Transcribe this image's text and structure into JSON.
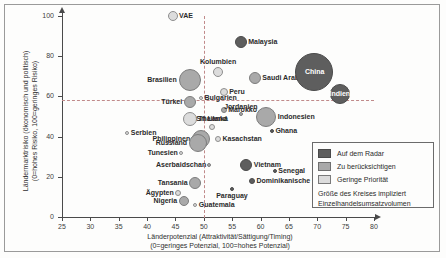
{
  "chart_data": {
    "type": "scatter",
    "title": "",
    "xlabel": "Länderpotenzial (Attraktivität/Sättigung/Timing)",
    "xlabel_sub": "(0=geringes Potenzial, 100=hohes Potenzial)",
    "ylabel": "Ländermarktrisiko (ökonomisch und politisch)",
    "ylabel_sub": "(0=hohes Risiko, 100=geringes Risiko)",
    "xlim": [
      25,
      80
    ],
    "ylim": [
      0,
      100
    ],
    "xticks": [
      25,
      30,
      35,
      40,
      45,
      50,
      55,
      60,
      65,
      70,
      75,
      80
    ],
    "yticks": [
      0,
      20,
      40,
      60,
      80,
      100
    ],
    "grid": false,
    "reference_lines": {
      "x": 50,
      "y": 58
    },
    "size_meaning": "Größe des Kreises impliziert Einzelhandelsumsatzvolumen",
    "points": [
      {
        "name": "VAE",
        "x": 44.5,
        "y": 100,
        "size": 5,
        "tier": "light",
        "label_pos": "right"
      },
      {
        "name": "Malaysia",
        "x": 56.5,
        "y": 87,
        "size": 6,
        "tier": "dark",
        "label_pos": "right"
      },
      {
        "name": "Kolumbien",
        "x": 52.5,
        "y": 72,
        "size": 5,
        "tier": "light",
        "label_pos": "top"
      },
      {
        "name": "Saudi Arabien",
        "x": 59.0,
        "y": 69,
        "size": 6,
        "tier": "mid",
        "label_pos": "right"
      },
      {
        "name": "Brasilien",
        "x": 47.5,
        "y": 68,
        "size": 11,
        "tier": "mid",
        "label_pos": "left"
      },
      {
        "name": "China",
        "x": 69.5,
        "y": 72,
        "size": 19,
        "tier": "dark",
        "label_pos": "center"
      },
      {
        "name": "Indien",
        "x": 74.0,
        "y": 61,
        "size": 10,
        "tier": "dark",
        "label_pos": "center"
      },
      {
        "name": "Peru",
        "x": 53.5,
        "y": 62,
        "size": 4,
        "tier": "light",
        "label_pos": "right"
      },
      {
        "name": "Türkei",
        "x": 47.5,
        "y": 57,
        "size": 6,
        "tier": "mid",
        "label_pos": "left"
      },
      {
        "name": "Bulgarien",
        "x": 49.5,
        "y": 59,
        "size": 2,
        "tier": "light",
        "label_pos": "right"
      },
      {
        "name": "Marokko",
        "x": 53.5,
        "y": 53,
        "size": 3,
        "tier": "mid",
        "label_pos": "right"
      },
      {
        "name": "Jordanien",
        "x": 56.5,
        "y": 51,
        "size": 2,
        "tier": "mid",
        "label_pos": "top"
      },
      {
        "name": "Indonesien",
        "x": 61.0,
        "y": 50,
        "size": 10,
        "tier": "mid",
        "label_pos": "right"
      },
      {
        "name": "Thailand",
        "x": 47.5,
        "y": 49,
        "size": 7,
        "tier": "light",
        "label_pos": "right"
      },
      {
        "name": "Sri Lanka",
        "x": 51.5,
        "y": 45,
        "size": 3,
        "tier": "light",
        "label_pos": "top"
      },
      {
        "name": "Ghana",
        "x": 62.0,
        "y": 43,
        "size": 2,
        "tier": "dark",
        "label_pos": "right"
      },
      {
        "name": "Serbien",
        "x": 36.5,
        "y": 42,
        "size": 2,
        "tier": "light",
        "label_pos": "right"
      },
      {
        "name": "Philippinen",
        "x": 49.5,
        "y": 39,
        "size": 9,
        "tier": "mid",
        "label_pos": "left"
      },
      {
        "name": "Russland",
        "x": 49.0,
        "y": 37,
        "size": 9,
        "tier": "mid",
        "label_pos": "left"
      },
      {
        "name": "Kasachstan",
        "x": 52.5,
        "y": 39,
        "size": 3,
        "tier": "light",
        "label_pos": "right"
      },
      {
        "name": "Tunesien",
        "x": 46.0,
        "y": 32,
        "size": 2,
        "tier": "light",
        "label_pos": "left"
      },
      {
        "name": "Aserbaidschan",
        "x": 51.0,
        "y": 26,
        "size": 2,
        "tier": "mid",
        "label_pos": "left"
      },
      {
        "name": "Vietnam",
        "x": 57.5,
        "y": 26,
        "size": 6,
        "tier": "dark",
        "label_pos": "right"
      },
      {
        "name": "Senegal",
        "x": 62.5,
        "y": 23,
        "size": 2,
        "tier": "dark",
        "label_pos": "right"
      },
      {
        "name": "Tansania",
        "x": 48.5,
        "y": 17,
        "size": 6,
        "tier": "mid",
        "label_pos": "left"
      },
      {
        "name": "Dominikanische Republik",
        "x": 58.5,
        "y": 18,
        "size": 3,
        "tier": "dark",
        "label_pos": "right"
      },
      {
        "name": "Paraguay",
        "x": 55.0,
        "y": 14,
        "size": 2,
        "tier": "dark",
        "label_pos": "bottom"
      },
      {
        "name": "Ägypten",
        "x": 45.5,
        "y": 12,
        "size": 3,
        "tier": "light",
        "label_pos": "left"
      },
      {
        "name": "Nigeria",
        "x": 46.5,
        "y": 8,
        "size": 5,
        "tier": "mid",
        "label_pos": "left"
      },
      {
        "name": "Guatemala",
        "x": 48.5,
        "y": 6,
        "size": 2,
        "tier": "light",
        "label_pos": "right"
      }
    ]
  },
  "legend": {
    "items": [
      {
        "label": "Auf dem Radar",
        "tier": "dark"
      },
      {
        "label": "Zu berücksichtigen",
        "tier": "mid"
      },
      {
        "label": "Geringe Priorität",
        "tier": "light"
      }
    ],
    "note_line1": "Größe des Kreises impliziert",
    "note_line2": "Einzelhandelsumsatzvolumen"
  },
  "colors": {
    "dark": "#5e5e5e",
    "mid": "#a9a9a9",
    "light": "#dcdcdc",
    "reference_line": "#c08a8a",
    "axis": "#4a4a4a"
  }
}
